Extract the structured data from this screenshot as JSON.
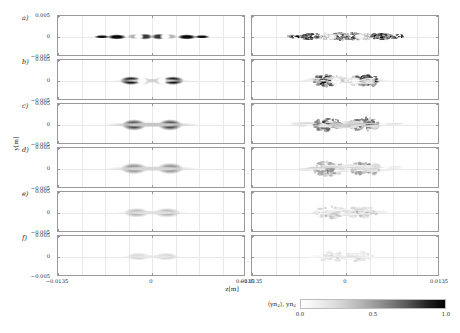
{
  "figure": {
    "xlabel": "z[m]",
    "ylabel": "y[m]",
    "panel_labels": [
      "a)",
      "b)",
      "c)",
      "d)",
      "e)",
      "f)"
    ],
    "x_ticks": [
      "−0.0135",
      "0",
      "0.0135"
    ],
    "y_ticks": [
      "0.005",
      "0",
      "−0.005"
    ],
    "colorbar": {
      "label": "⟨yn₂⟩, yn₂",
      "ticks": [
        "0.0",
        "0.5",
        "1.0"
      ],
      "low_color": "#ffffff",
      "high_color": "#000000"
    }
  },
  "chart_data": {
    "type": "heatmap",
    "title": "",
    "xlabel": "z[m]",
    "ylabel": "y[m]",
    "xlim": [
      -0.0135,
      0.0135
    ],
    "ylim": [
      -0.005,
      0.005
    ],
    "xticks": [
      -0.0135,
      0,
      0.0135
    ],
    "yticks": [
      -0.005,
      0,
      0.005
    ],
    "colormap": "grayscale_white_to_black",
    "color_range": [
      0.0,
      1.0
    ],
    "colorbar_label": "⟨yn₂⟩, yn₂",
    "grid": true,
    "legend_position": "none",
    "rows": 6,
    "columns": 2,
    "row_labels": [
      "a)",
      "b)",
      "c)",
      "d)",
      "e)",
      "f)"
    ],
    "column_descriptions": [
      "ensemble-averaged ⟨yn₂⟩ (smooth)",
      "single-shot yn₂ (noisy/speckled)"
    ],
    "panels": [
      {
        "label": "a)",
        "peak_value": 1.0,
        "structure": "six alternating dark lobes along z with two bright white gaps near z = ±0.0024",
        "z_extent": [
          -0.0082,
          0.0082
        ],
        "y_extent": [
          -0.0016,
          0.0016
        ],
        "blobs": [
          {
            "z": -0.0072,
            "y": 0.0,
            "zr": 0.0013,
            "yr": 0.00055,
            "v": 0.93
          },
          {
            "z": -0.005,
            "y": 0.0,
            "zr": 0.0016,
            "yr": 0.00075,
            "v": 0.97
          },
          {
            "z": -0.0026,
            "y": 0.0,
            "zr": 0.0012,
            "yr": 0.00085,
            "v": 0.3
          },
          {
            "z": -0.001,
            "y": 0.0,
            "zr": 0.0013,
            "yr": 0.00095,
            "v": 0.78
          },
          {
            "z": 0.001,
            "y": 0.0,
            "zr": 0.0013,
            "yr": 0.00095,
            "v": 0.78
          },
          {
            "z": 0.0026,
            "y": 0.0,
            "zr": 0.0012,
            "yr": 0.00085,
            "v": 0.3
          },
          {
            "z": 0.005,
            "y": 0.0,
            "zr": 0.0016,
            "yr": 0.00075,
            "v": 0.97
          },
          {
            "z": 0.0072,
            "y": 0.0,
            "zr": 0.0013,
            "yr": 0.00055,
            "v": 0.93
          }
        ]
      },
      {
        "label": "b)",
        "peak_value": 1.0,
        "structure": "two dark crescents centred near z = ±0.0020 with bright cores, faint halo extending to ±0.009",
        "z_extent": [
          -0.009,
          0.009
        ],
        "y_extent": [
          -0.0022,
          0.0022
        ],
        "blobs": [
          {
            "z": -0.003,
            "y": 0.0,
            "zr": 0.0018,
            "yr": 0.0013,
            "v": 0.95
          },
          {
            "z": -0.0012,
            "y": 0.0,
            "zr": 0.001,
            "yr": 0.0011,
            "v": 0.25
          },
          {
            "z": 0.0012,
            "y": 0.0,
            "zr": 0.001,
            "yr": 0.0011,
            "v": 0.25
          },
          {
            "z": 0.003,
            "y": 0.0,
            "zr": 0.0018,
            "yr": 0.0013,
            "v": 0.95
          },
          {
            "z": 0.0,
            "y": 0.0,
            "zr": 0.0065,
            "yr": 0.0007,
            "v": 0.18
          }
        ]
      },
      {
        "label": "c)",
        "peak_value": 0.72,
        "structure": "bow-tie pair of grey lobes near z = ±0.0022, broad faint wings",
        "z_extent": [
          -0.0105,
          0.0105
        ],
        "y_extent": [
          -0.0026,
          0.0026
        ],
        "blobs": [
          {
            "z": -0.0026,
            "y": 0.0,
            "zr": 0.002,
            "yr": 0.0016,
            "v": 0.7
          },
          {
            "z": 0.0026,
            "y": 0.0,
            "zr": 0.002,
            "yr": 0.0016,
            "v": 0.7
          },
          {
            "z": 0.0,
            "y": 0.0,
            "zr": 0.008,
            "yr": 0.0008,
            "v": 0.22
          }
        ]
      },
      {
        "label": "d)",
        "peak_value": 0.45,
        "structure": "diffuse bow-tie, weaker than c), wings reach ±0.010",
        "z_extent": [
          -0.0105,
          0.0105
        ],
        "y_extent": [
          -0.0028,
          0.0028
        ],
        "blobs": [
          {
            "z": -0.0026,
            "y": 0.0,
            "zr": 0.0022,
            "yr": 0.0017,
            "v": 0.42
          },
          {
            "z": 0.0026,
            "y": 0.0,
            "zr": 0.0022,
            "yr": 0.0017,
            "v": 0.42
          },
          {
            "z": 0.0,
            "y": 0.0,
            "zr": 0.008,
            "yr": 0.0008,
            "v": 0.16
          }
        ]
      },
      {
        "label": "e)",
        "peak_value": 0.28,
        "structure": "faint single elongated cloud with two weak maxima",
        "z_extent": [
          -0.008,
          0.008
        ],
        "y_extent": [
          -0.0022,
          0.0022
        ],
        "blobs": [
          {
            "z": -0.0022,
            "y": 0.0,
            "zr": 0.0022,
            "yr": 0.0014,
            "v": 0.27
          },
          {
            "z": 0.0022,
            "y": 0.0,
            "zr": 0.0022,
            "yr": 0.0014,
            "v": 0.27
          },
          {
            "z": 0.0,
            "y": 0.0,
            "zr": 0.006,
            "yr": 0.0007,
            "v": 0.12
          }
        ]
      },
      {
        "label": "f)",
        "peak_value": 0.18,
        "structure": "weakest panel, very faint twin cloud",
        "z_extent": [
          -0.007,
          0.007
        ],
        "y_extent": [
          -0.0018,
          0.0018
        ],
        "blobs": [
          {
            "z": -0.002,
            "y": 0.0,
            "zr": 0.002,
            "yr": 0.0012,
            "v": 0.17
          },
          {
            "z": 0.002,
            "y": 0.0,
            "zr": 0.002,
            "yr": 0.0012,
            "v": 0.17
          },
          {
            "z": 0.0,
            "y": 0.0,
            "zr": 0.005,
            "yr": 0.0006,
            "v": 0.09
          }
        ]
      }
    ]
  }
}
